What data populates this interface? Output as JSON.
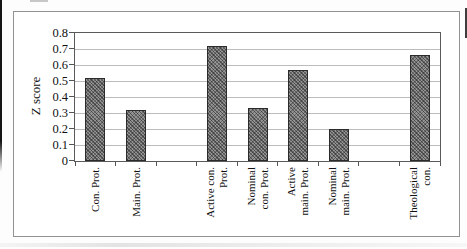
{
  "chart_data": {
    "type": "bar",
    "title": "",
    "ylabel": "Z score",
    "xlabel": "",
    "ylim": [
      0,
      0.8
    ],
    "ytick_step": 0.1,
    "ytick_labels": [
      "0.8",
      "0.7",
      "0.6",
      "0.5",
      "0.4",
      "0.3",
      "0.2",
      "0.1",
      "0"
    ],
    "grid": true,
    "legend": "none",
    "bar_fill": "#949494",
    "bar_border": "#2b2b2b",
    "categories": [
      "Con. Prot.",
      "Main. Prot.",
      "Active con. Prot.",
      "Nominal con. Prot.",
      "Active main. Prot.",
      "Nominal main. Prot.",
      "Theological con."
    ],
    "values": [
      0.52,
      0.32,
      0.72,
      0.33,
      0.57,
      0.2,
      0.66
    ],
    "category_slots": 9,
    "slot_index": [
      0,
      1,
      3,
      4,
      5,
      6,
      8
    ],
    "label_lines": [
      [
        "Con. Prot."
      ],
      [
        "Main. Prot."
      ],
      [
        "Active con.",
        "Prot."
      ],
      [
        "Nominal",
        "con. Prot."
      ],
      [
        "Active",
        "main. Prot."
      ],
      [
        "Nominal",
        "main. Prot."
      ],
      [
        "Theological",
        "con."
      ]
    ]
  }
}
